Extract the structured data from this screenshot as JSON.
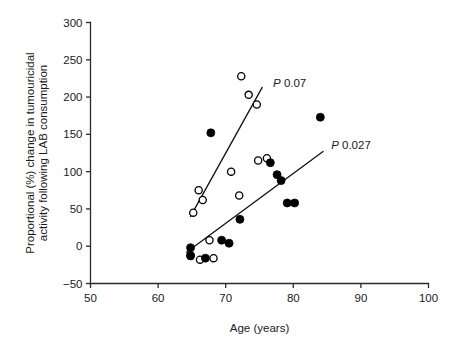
{
  "chart_data": {
    "type": "scatter",
    "title": "",
    "xlabel": "Age (years)",
    "ylabel": "Proportional (%) change in tumouricidal activity following LAB consumption",
    "ylabel_line1": "Proportional (%) change in tumouricidal",
    "ylabel_line2": "activity following LAB consumption",
    "xlim": [
      50,
      100
    ],
    "ylim": [
      -50,
      300
    ],
    "xticks": [
      50,
      60,
      70,
      80,
      90,
      100
    ],
    "yticks": [
      -50,
      0,
      50,
      100,
      150,
      200,
      250,
      300
    ],
    "xtick_labels": [
      "50",
      "60",
      "70",
      "80",
      "90",
      "100"
    ],
    "ytick_labels": [
      "-50",
      "0",
      "50",
      "100",
      "150",
      "200",
      "250",
      "300"
    ],
    "grid": false,
    "legend_position": "none",
    "series": [
      {
        "name": "open-circles",
        "marker": "open-circle",
        "color": "#000000",
        "points": [
          {
            "x": 64.8,
            "y": -12
          },
          {
            "x": 66.2,
            "y": -18
          },
          {
            "x": 65.2,
            "y": 45
          },
          {
            "x": 66.0,
            "y": 75
          },
          {
            "x": 66.6,
            "y": 62
          },
          {
            "x": 67.6,
            "y": 8
          },
          {
            "x": 68.2,
            "y": -16
          },
          {
            "x": 70.8,
            "y": 100
          },
          {
            "x": 72.0,
            "y": 68
          },
          {
            "x": 72.3,
            "y": 228
          },
          {
            "x": 73.4,
            "y": 203
          },
          {
            "x": 74.6,
            "y": 190
          },
          {
            "x": 74.8,
            "y": 115
          },
          {
            "x": 76.1,
            "y": 118
          }
        ]
      },
      {
        "name": "filled-circles",
        "marker": "filled-circle",
        "color": "#000000",
        "points": [
          {
            "x": 64.8,
            "y": -2
          },
          {
            "x": 64.8,
            "y": -13
          },
          {
            "x": 67.0,
            "y": -16
          },
          {
            "x": 67.8,
            "y": 152
          },
          {
            "x": 69.4,
            "y": 8
          },
          {
            "x": 70.5,
            "y": 4
          },
          {
            "x": 72.1,
            "y": 36
          },
          {
            "x": 76.6,
            "y": 112
          },
          {
            "x": 77.6,
            "y": 96
          },
          {
            "x": 78.2,
            "y": 88
          },
          {
            "x": 79.1,
            "y": 58
          },
          {
            "x": 80.2,
            "y": 58
          },
          {
            "x": 84.0,
            "y": 173
          }
        ]
      }
    ],
    "fit_lines": [
      {
        "name": "open-circles-fit",
        "label": "P 0.07",
        "p_value": "0.07",
        "x_start": 64.8,
        "y_start": 40,
        "x_end": 75.4,
        "y_end": 213
      },
      {
        "name": "filled-circles-fit",
        "label": "P 0.027",
        "p_value": "0.027",
        "x_start": 64.2,
        "y_start": -8,
        "x_end": 84.4,
        "y_end": 127
      }
    ],
    "annotations": [
      {
        "name": "p-value-open",
        "text": "P 0.07",
        "x": 77.0,
        "y": 213
      },
      {
        "name": "p-value-filled",
        "text": "P 0.027",
        "x": 85.6,
        "y": 131
      }
    ]
  }
}
